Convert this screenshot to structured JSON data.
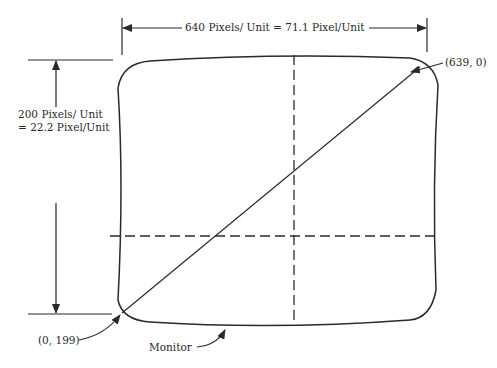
{
  "diagram": {
    "width_dimension": {
      "label": "640 Pixels/ Unit  =  71.1  Pixel/Unit"
    },
    "height_dimension": {
      "line1": "200 Pixels/ Unit",
      "line2": "=  22.2  Pixel/Unit"
    },
    "callouts": {
      "top_right": "(639,  0)",
      "bottom_left": "(0,  199)",
      "monitor": "Monitor"
    },
    "colors": {
      "stroke": "#2a2a2a",
      "background": "#ffffff"
    }
  }
}
